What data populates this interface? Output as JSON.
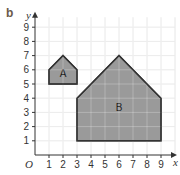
{
  "part_label": "b",
  "axes": {
    "x_label": "x",
    "y_label": "y",
    "origin_label": "O",
    "x_ticks": [
      "1",
      "2",
      "3",
      "4",
      "5",
      "6",
      "7",
      "8",
      "9"
    ],
    "y_ticks": [
      "1",
      "2",
      "3",
      "4",
      "5",
      "6",
      "7",
      "8",
      "9"
    ]
  },
  "shapes": [
    {
      "label": "A",
      "vertices": [
        [
          1,
          5
        ],
        [
          1,
          6
        ],
        [
          2,
          7
        ],
        [
          3,
          6
        ],
        [
          3,
          5
        ]
      ],
      "fill": "#9a9a9a"
    },
    {
      "label": "B",
      "vertices": [
        [
          3,
          1
        ],
        [
          3,
          4
        ],
        [
          6,
          7
        ],
        [
          9,
          4
        ],
        [
          9,
          1
        ]
      ],
      "fill": "#9a9a9a"
    }
  ],
  "colors": {
    "grid": "#e6e6e6",
    "axis": "#333333",
    "shape_stroke": "#333333"
  }
}
